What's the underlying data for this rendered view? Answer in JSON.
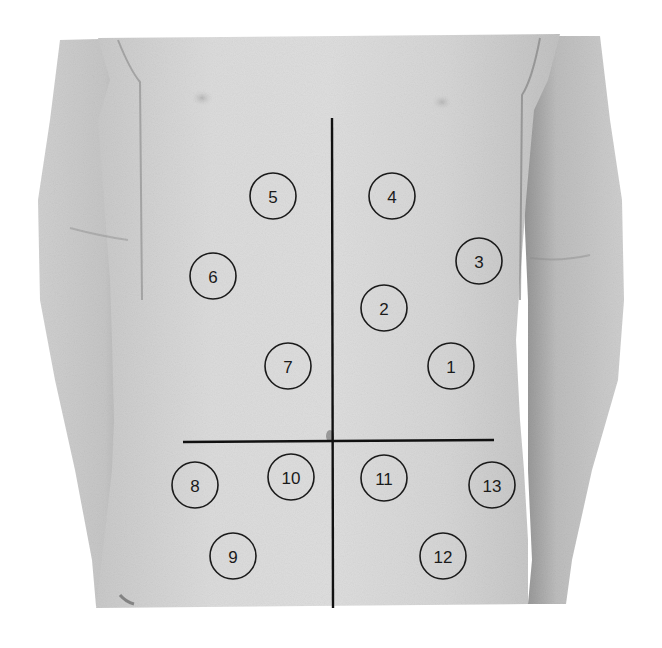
{
  "figure": {
    "colors": {
      "background": "#ffffff",
      "skin_light": "#d8d8d8",
      "skin_mid": "#c4c4c4",
      "skin_shadow": "#9a9a9a",
      "line": "#111111",
      "marker": "#1a1a1a"
    },
    "lines": {
      "vertical_midline": {
        "x1": 332,
        "y1": 118,
        "x2": 333,
        "y2": 608
      },
      "horizontal_umbilical": {
        "x1": 183,
        "y1": 442,
        "x2": 494,
        "y2": 440
      }
    },
    "marker_radius": 23,
    "markers": [
      {
        "label": "1",
        "cx": 451,
        "cy": 366
      },
      {
        "label": "2",
        "cx": 384,
        "cy": 308
      },
      {
        "label": "3",
        "cx": 479,
        "cy": 261
      },
      {
        "label": "4",
        "cx": 392,
        "cy": 196
      },
      {
        "label": "5",
        "cx": 273,
        "cy": 196
      },
      {
        "label": "6",
        "cx": 213,
        "cy": 276
      },
      {
        "label": "7",
        "cx": 288,
        "cy": 366
      },
      {
        "label": "8",
        "cx": 195,
        "cy": 485
      },
      {
        "label": "9",
        "cx": 233,
        "cy": 556
      },
      {
        "label": "10",
        "cx": 291,
        "cy": 477
      },
      {
        "label": "11",
        "cx": 384,
        "cy": 478
      },
      {
        "label": "12",
        "cx": 443,
        "cy": 556
      },
      {
        "label": "13",
        "cx": 492,
        "cy": 485
      }
    ]
  }
}
